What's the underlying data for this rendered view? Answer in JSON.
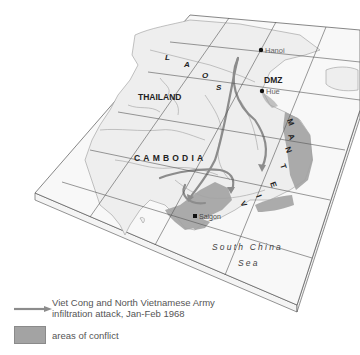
{
  "map": {
    "countries": [
      {
        "name": "LAOS",
        "letters": [
          "L",
          "A",
          "O",
          "S"
        ]
      },
      {
        "name": "THAILAND"
      },
      {
        "name": "CAMBODIA"
      },
      {
        "name": "VIETNAM",
        "letters": [
          "V",
          "I",
          "E",
          "T",
          "N",
          "A",
          "M"
        ]
      }
    ],
    "cities": [
      {
        "name": "Hanoi"
      },
      {
        "name": "Hue"
      },
      {
        "name": "Saigon"
      }
    ],
    "landmarks": [
      {
        "name": "DMZ"
      }
    ],
    "sea": {
      "line1": "South China",
      "line2": "Sea"
    },
    "colors": {
      "land": "#efefef",
      "sea": "#f7f7f7",
      "conflict": "#a3a3a3",
      "arrow": "#8c8c8c",
      "border": "#9a9a9a",
      "grid": "#555555"
    }
  },
  "legend": {
    "arrow_label_line1": "Viet Cong and North Vietnamese Army",
    "arrow_label_line2": "infiltration attack, Jan-Feb 1968",
    "area_label": "areas of conflict"
  }
}
